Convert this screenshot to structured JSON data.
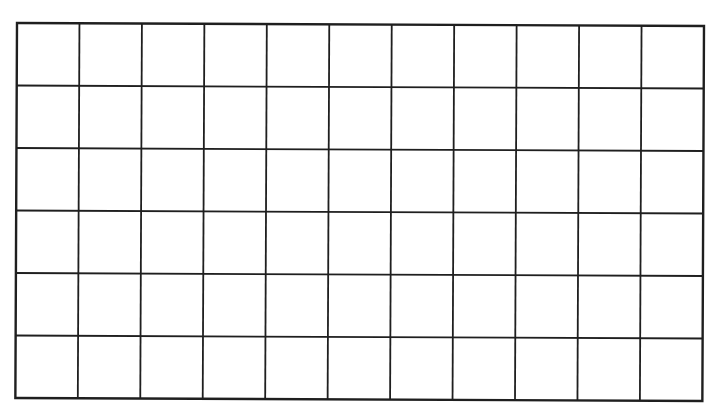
{
  "grid": {
    "columns": 11,
    "rows": 6,
    "x": 0,
    "y": 0,
    "width": 687,
    "height": 375,
    "line_color": "#1f1f1f",
    "outer_line_width": 2.4,
    "inner_line_width": 1.8,
    "background": "#ffffff",
    "cells": [
      [
        "",
        "",
        "",
        "",
        "",
        "",
        "",
        "",
        "",
        "",
        ""
      ],
      [
        "",
        "",
        "",
        "",
        "",
        "",
        "",
        "",
        "",
        "",
        ""
      ],
      [
        "",
        "",
        "",
        "",
        "",
        "",
        "",
        "",
        "",
        "",
        ""
      ],
      [
        "",
        "",
        "",
        "",
        "",
        "",
        "",
        "",
        "",
        "",
        ""
      ],
      [
        "",
        "",
        "",
        "",
        "",
        "",
        "",
        "",
        "",
        "",
        ""
      ],
      [
        "",
        "",
        "",
        "",
        "",
        "",
        "",
        "",
        "",
        "",
        ""
      ]
    ]
  }
}
